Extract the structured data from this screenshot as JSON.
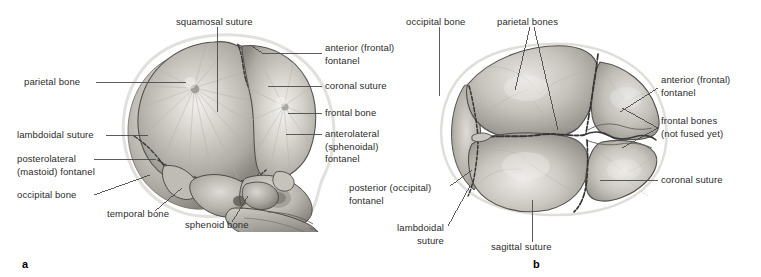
{
  "figure": {
    "background_color": "#ffffff",
    "text_color": "#2b2b2b",
    "panels": [
      {
        "letter": "a",
        "view": "lateral",
        "x": 22,
        "y": 262
      },
      {
        "letter": "b",
        "view": "superior",
        "x": 533,
        "y": 262
      }
    ]
  },
  "panel_a": {
    "letter": "a",
    "labels": [
      {
        "id": "squamosal-suture",
        "text": "squamosal suture",
        "x": 176,
        "y": 16,
        "align": "left"
      },
      {
        "id": "anterior-fontanel",
        "text": "anterior (frontal)\nfontanel",
        "x": 325,
        "y": 42,
        "align": "left"
      },
      {
        "id": "coronal-suture",
        "text": "coronal suture",
        "x": 325,
        "y": 83,
        "align": "left"
      },
      {
        "id": "frontal-bone",
        "text": "frontal bone",
        "x": 325,
        "y": 110,
        "align": "left"
      },
      {
        "id": "anterolateral-fontanel",
        "text": "anterolateral\n(sphenoidal)\nfontanel",
        "x": 325,
        "y": 131,
        "align": "left"
      },
      {
        "id": "parietal-bone",
        "text": "parietal bone",
        "x": 24,
        "y": 79,
        "align": "left"
      },
      {
        "id": "lambdoidal-suture",
        "text": "lambdoidal suture",
        "x": 17,
        "y": 132,
        "align": "left"
      },
      {
        "id": "posterolateral-fontanel",
        "text": "posterolateral\n(mastoid) fontanel",
        "x": 17,
        "y": 156,
        "align": "left"
      },
      {
        "id": "occipital-bone",
        "text": "occipital bone",
        "x": 17,
        "y": 192,
        "align": "left"
      },
      {
        "id": "temporal-bone",
        "text": "temporal bone",
        "x": 107,
        "y": 214,
        "align": "left"
      },
      {
        "id": "sphenoid-bone",
        "text": "sphenoid bone",
        "x": 185,
        "y": 225,
        "align": "left"
      }
    ]
  },
  "panel_b": {
    "letter": "b",
    "labels": [
      {
        "id": "occipital-bone",
        "text": "occipital bone",
        "x": 408,
        "y": 16,
        "align": "left"
      },
      {
        "id": "parietal-bones",
        "text": "parietal bones",
        "x": 497,
        "y": 16,
        "align": "left"
      },
      {
        "id": "anterior-fontanel",
        "text": "anterior (frontal)\nfontanel",
        "x": 661,
        "y": 77,
        "align": "left"
      },
      {
        "id": "frontal-bones",
        "text": "frontal bones\n(not fused yet)",
        "x": 661,
        "y": 118,
        "align": "left"
      },
      {
        "id": "coronal-suture",
        "text": "coronal suture",
        "x": 661,
        "y": 177,
        "align": "left"
      },
      {
        "id": "posterior-fontanel",
        "text": "posterior (occipital)\nfontanel",
        "x": 349,
        "y": 188,
        "align": "left"
      },
      {
        "id": "lambdoidal-suture",
        "text": "lambdoidal\nsuture",
        "x": 404,
        "y": 228,
        "align": "left"
      },
      {
        "id": "sagittal-suture",
        "text": "sagittal suture",
        "x": 491,
        "y": 245,
        "align": "left"
      }
    ]
  },
  "colors": {
    "leader_line": "#4a4a4a",
    "bone_light": "#e8e6e2",
    "bone_mid": "#bdbab4",
    "bone_dark": "#8d8a85",
    "bone_shadow": "#6a6762",
    "suture_line": "#3a3a3a",
    "outline_halo": "#d8d6d2"
  }
}
